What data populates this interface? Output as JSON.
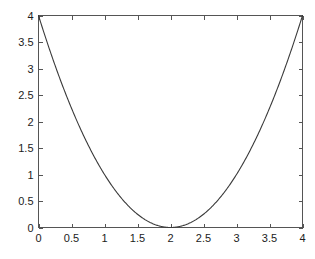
{
  "chart_data": {
    "type": "line",
    "title": "",
    "subtitle": "",
    "xlabel": "",
    "ylabel": "",
    "xlim": [
      0,
      4
    ],
    "ylim": [
      0,
      4
    ],
    "grid": false,
    "legend": false,
    "legend_position": "none",
    "box_frame": true,
    "tick_direction": "in",
    "background_color": "#ffffff",
    "line_color": "#3a3a3a",
    "axis_color": "#555555",
    "x_ticks": [
      0,
      0.5,
      1,
      1.5,
      2,
      2.5,
      3,
      3.5,
      4
    ],
    "y_ticks": [
      0,
      0.5,
      1,
      1.5,
      2,
      2.5,
      3,
      3.5,
      4
    ],
    "x_tick_labels": [
      "0",
      "0.5",
      "1",
      "1.5",
      "2",
      "2.5",
      "3",
      "3.5",
      "4"
    ],
    "y_tick_labels": [
      "0",
      "0.5",
      "1",
      "1.5",
      "2",
      "2.5",
      "3",
      "3.5",
      "4"
    ],
    "series": [
      {
        "name": "y = (x - 2)^2",
        "x": [
          0,
          0.1,
          0.2,
          0.3,
          0.4,
          0.5,
          0.6,
          0.7,
          0.8,
          0.9,
          1.0,
          1.1,
          1.2,
          1.3,
          1.4,
          1.5,
          1.6,
          1.7,
          1.8,
          1.9,
          2.0,
          2.1,
          2.2,
          2.3,
          2.4,
          2.5,
          2.6,
          2.7,
          2.8,
          2.9,
          3.0,
          3.1,
          3.2,
          3.3,
          3.4,
          3.5,
          3.6,
          3.7,
          3.8,
          3.9,
          4.0
        ],
        "values": [
          4.0,
          3.61,
          3.24,
          2.89,
          2.56,
          2.25,
          1.96,
          1.69,
          1.44,
          1.21,
          1.0,
          0.81,
          0.64,
          0.49,
          0.36,
          0.25,
          0.16,
          0.09,
          0.04,
          0.01,
          0.0,
          0.01,
          0.04,
          0.09,
          0.16,
          0.25,
          0.36,
          0.49,
          0.64,
          0.81,
          1.0,
          1.21,
          1.44,
          1.69,
          1.96,
          2.25,
          2.56,
          2.89,
          3.24,
          3.61,
          4.0
        ]
      }
    ],
    "annotations": []
  }
}
